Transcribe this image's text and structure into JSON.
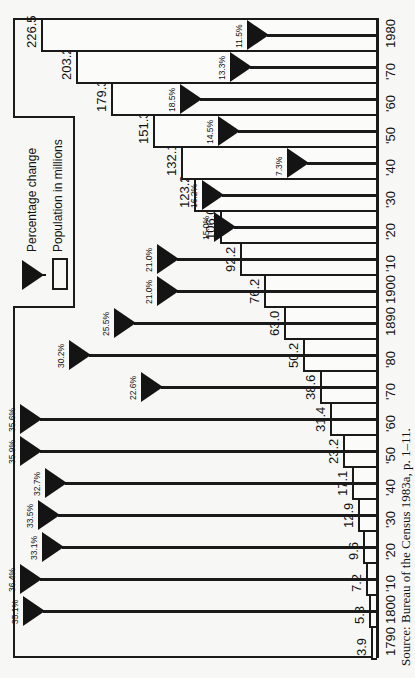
{
  "chart_data": {
    "type": "bar",
    "orientation": "rotated 90 degrees counter-clockwise (bars extend from right baseline toward left)",
    "title": "",
    "xlabel": "Census year",
    "ylabel": "Population in millions",
    "categories": [
      "1790",
      "1800",
      "'10",
      "'20",
      "'30",
      "'40",
      "'50",
      "'60",
      "'70",
      "'80",
      "1890",
      "1900",
      "'10",
      "'20",
      "'30",
      "'40",
      "'50",
      "'60",
      "'70",
      "1980"
    ],
    "years": [
      1790,
      1800,
      1810,
      1820,
      1830,
      1840,
      1850,
      1860,
      1870,
      1880,
      1890,
      1900,
      1910,
      1920,
      1930,
      1940,
      1950,
      1960,
      1970,
      1980
    ],
    "series": [
      {
        "name": "Population in millions",
        "marker": "open rectangle",
        "values": [
          3.9,
          5.3,
          7.2,
          9.6,
          12.9,
          17.1,
          23.2,
          31.4,
          38.6,
          50.2,
          63.0,
          76.2,
          92.2,
          106.0,
          123.2,
          132.1,
          151.3,
          179.3,
          203.2,
          226.5
        ],
        "labels": [
          "3.9",
          "5.3",
          "7.2",
          "9.6",
          "12.9",
          "17.1",
          "23.2",
          "31.4",
          "38.6",
          "50.2",
          "63.0",
          "76.2",
          "92.2",
          "106.0",
          "123.2",
          "132.1",
          "151.3",
          "179.3",
          "203.2",
          "226.5"
        ]
      },
      {
        "name": "Percentage change",
        "marker": "filled triangle",
        "values": [
          null,
          35.1,
          36.4,
          33.1,
          33.5,
          32.7,
          35.9,
          35.6,
          22.6,
          30.2,
          25.5,
          21.0,
          21.0,
          15.0,
          16.2,
          7.3,
          14.5,
          18.5,
          13.3,
          11.5
        ],
        "labels": [
          null,
          "35.1%",
          "36.4%",
          "33.1%",
          "33.5%",
          "32.7%",
          "35.9%",
          "35.6%",
          "22.6%",
          "30.2%",
          "25.5%",
          "21.0%",
          "21.0%",
          "15.0%",
          "16.2%",
          "7.3%",
          "14.5%",
          "18.5%",
          "13.3%",
          "11.5%"
        ]
      }
    ],
    "legend": {
      "position": "upper-left (rotated)",
      "entries": [
        "Percentage change",
        "Population in millions"
      ]
    },
    "ylim": [
      0,
      240
    ],
    "grid": false,
    "annotation": "Source: Bureau of the Census 1983a, p. 1–11."
  },
  "legend": {
    "percentage_label": "Percentage change",
    "population_label": "Population in millions"
  },
  "source_note": "Source: Bureau of the Census 1983a, p. 1–11.",
  "bars": [
    {
      "year_label": "1790",
      "pop": "3.9",
      "pct": ""
    },
    {
      "year_label": "1800",
      "pop": "5.3",
      "pct": "35.1%"
    },
    {
      "year_label": "'10",
      "pop": "7.2",
      "pct": "36.4%"
    },
    {
      "year_label": "'20",
      "pop": "9.6",
      "pct": "33.1%"
    },
    {
      "year_label": "'30",
      "pop": "12.9",
      "pct": "33.5%"
    },
    {
      "year_label": "'40",
      "pop": "17.1",
      "pct": "32.7%"
    },
    {
      "year_label": "'50",
      "pop": "23.2",
      "pct": "35.9%"
    },
    {
      "year_label": "'60",
      "pop": "31.4",
      "pct": "35.6%"
    },
    {
      "year_label": "'70",
      "pop": "38.6",
      "pct": "22.6%"
    },
    {
      "year_label": "'80",
      "pop": "50.2",
      "pct": "30.2%"
    },
    {
      "year_label": "1890",
      "pop": "63.0",
      "pct": "25.5%"
    },
    {
      "year_label": "1900",
      "pop": "76.2",
      "pct": "21.0%"
    },
    {
      "year_label": "'10",
      "pop": "92.2",
      "pct": "21.0%"
    },
    {
      "year_label": "'20",
      "pop": "106.0",
      "pct": "15.0%"
    },
    {
      "year_label": "'30",
      "pop": "123.2",
      "pct": "16.2%"
    },
    {
      "year_label": "'40",
      "pop": "132.1",
      "pct": "7.3%"
    },
    {
      "year_label": "'50",
      "pop": "151.3",
      "pct": "14.5%"
    },
    {
      "year_label": "'60",
      "pop": "179.3",
      "pct": "18.5%"
    },
    {
      "year_label": "'70",
      "pop": "203.2",
      "pct": "13.3%"
    },
    {
      "year_label": "1980",
      "pop": "226.5",
      "pct": "11.5%"
    }
  ]
}
